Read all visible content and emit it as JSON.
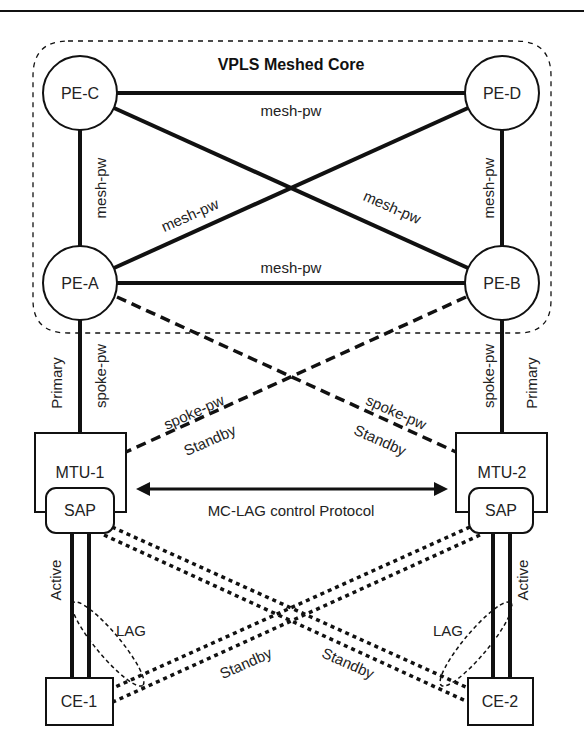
{
  "diagram": {
    "title": "VPLS Meshed Core",
    "colors": {
      "line": "#111111",
      "background": "#ffffff",
      "text": "#222222"
    },
    "nodes": {
      "pe_c": "PE-C",
      "pe_d": "PE-D",
      "pe_a": "PE-A",
      "pe_b": "PE-B",
      "mtu_1": "MTU-1",
      "mtu_2": "MTU-2",
      "sap_1": "SAP",
      "sap_2": "SAP",
      "ce_1": "CE-1",
      "ce_2": "CE-2"
    },
    "labels": {
      "mesh_top": "mesh-pw",
      "mesh_left": "mesh-pw",
      "mesh_right": "mesh-pw",
      "mesh_diag_a_d": "mesh-pw",
      "mesh_diag_c_b": "mesh-pw",
      "mesh_bottom": "mesh-pw",
      "primary_left": "Primary",
      "spoke_left": "spoke-pw",
      "primary_right": "Primary",
      "spoke_right": "spoke-pw",
      "spoke_diag_left": "spoke-pw",
      "standby_diag_left": "Standby",
      "spoke_diag_right": "spoke-pw",
      "standby_diag_right": "Standby",
      "mclag": "MC-LAG control Protocol",
      "active_left": "Active",
      "active_right": "Active",
      "lag_left": "LAG",
      "lag_right": "LAG",
      "standby_lag_left": "Standby",
      "standby_lag_right": "Standby"
    }
  }
}
